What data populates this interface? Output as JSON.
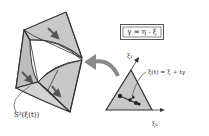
{
  "figure": {
    "type": "diagram",
    "formula_box": "γ = η - ξ",
    "simplex_label": "ξ(t) = ξ + tγ",
    "surface_label": "S²(ξ(t))",
    "axis_top": "ξ₁",
    "axis_right": "ξ₀",
    "inner_labels": [
      "ξ",
      "η"
    ],
    "colors": {
      "face_fill": "#c8c8c8",
      "edge": "#333333",
      "arrow": "#777777",
      "inner_arrow": "#555555"
    }
  }
}
